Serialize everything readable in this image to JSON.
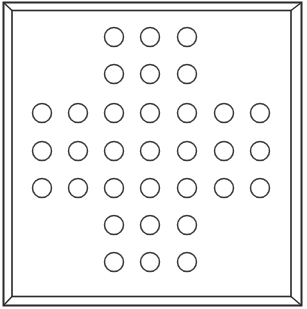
{
  "game": {
    "name": "Peg Solitaire",
    "board_shape": "english-cross",
    "holes_total": 33,
    "rows": [
      {
        "row": 0,
        "cols": [
          2,
          3,
          4
        ]
      },
      {
        "row": 1,
        "cols": [
          2,
          3,
          4
        ]
      },
      {
        "row": 2,
        "cols": [
          0,
          1,
          2,
          3,
          4,
          5,
          6
        ]
      },
      {
        "row": 3,
        "cols": [
          0,
          1,
          2,
          3,
          4,
          5,
          6
        ]
      },
      {
        "row": 4,
        "cols": [
          0,
          1,
          2,
          3,
          4,
          5,
          6
        ]
      },
      {
        "row": 5,
        "cols": [
          2,
          3,
          4
        ]
      },
      {
        "row": 6,
        "cols": [
          2,
          3,
          4
        ]
      }
    ],
    "hole_state": "empty",
    "colors": {
      "line": "#2a2a2a",
      "background": "#ffffff"
    }
  }
}
